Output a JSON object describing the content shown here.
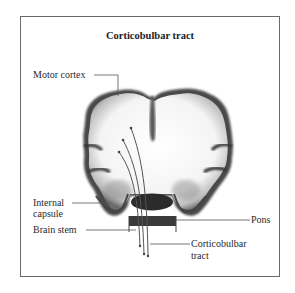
{
  "diagram": {
    "title": "Corticobulbar tract",
    "labels": {
      "motor_cortex": "Motor cortex",
      "internal_capsule_line1": "Internal",
      "internal_capsule_line2": "capsule",
      "brain_stem": "Brain stem",
      "pons": "Pons",
      "corticobulbar_line1": "Corticobulbar",
      "corticobulbar_line2": "tract"
    },
    "structures": [
      "motor cortex",
      "internal capsule",
      "brain stem",
      "pons",
      "corticobulbar tract fibers"
    ],
    "colors": {
      "frame": "#6a6a6a",
      "cortex_dark": "#3a3a3a",
      "white_matter": "#ffffff",
      "fiber_line": "#555555"
    }
  }
}
